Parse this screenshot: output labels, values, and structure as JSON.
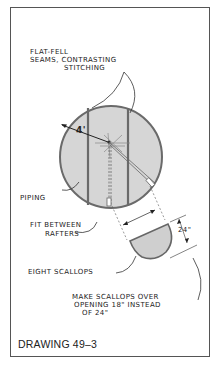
{
  "figure": {
    "caption": "DRAWING 49–3",
    "labels": {
      "seams_line1": "FLAT-FELL",
      "seams_line2": "SEAMS, CONTRASTING",
      "seams_line3": "STITCHING",
      "radius": "4'",
      "piping": "PIPING",
      "fit_line1": "FIT BETWEEN",
      "fit_line2": "RAFTERS",
      "height": "24\"",
      "scallops": "EIGHT SCALLOPS",
      "note_line1": "MAKE SCALLOPS OVER",
      "note_line2": "OPENING 18\" INSTEAD",
      "note_line3": "OF 24\""
    },
    "colors": {
      "fill": "#d4d4d4",
      "stroke": "#555555",
      "text": "#222222"
    }
  }
}
